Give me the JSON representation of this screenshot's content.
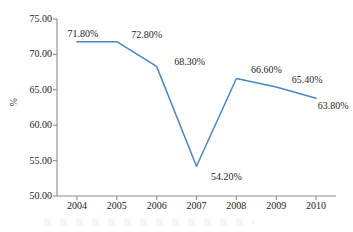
{
  "chart_data": {
    "type": "line",
    "title": "",
    "subtitle": "",
    "xlabel": "",
    "ylabel": "%",
    "categories": [
      "2004",
      "2005",
      "2006",
      "2007",
      "2008",
      "2009",
      "2010"
    ],
    "values": [
      71.8,
      71.8,
      68.3,
      54.2,
      66.6,
      65.4,
      63.8
    ],
    "point_labels": [
      "71.80%",
      "72.80%",
      "68.30%",
      "54.20%",
      "66.60%",
      "65.40%",
      "63.80%"
    ],
    "series": [
      {
        "name": "",
        "values": [
          71.8,
          71.8,
          68.3,
          54.2,
          66.6,
          65.4,
          63.8
        ]
      }
    ],
    "ylim": [
      50.0,
      75.0
    ],
    "ytick_step": 5.0,
    "ytick_labels": [
      "75.00",
      "70.00",
      "65.00",
      "60.00",
      "55.00",
      "50.00"
    ],
    "ytick_values": [
      75.0,
      70.0,
      65.0,
      60.0,
      55.0,
      50.0
    ],
    "xtick_labels": [
      "2004",
      "2005",
      "2006",
      "2007",
      "2008",
      "2009",
      "2010"
    ],
    "grid": false,
    "legend": false,
    "legend_position": "none",
    "markers": false,
    "line_color": "#4a87c4",
    "axis_color": "#8d8d8d",
    "background_color": "#ffffff",
    "text_color": "#232323",
    "annotations": []
  }
}
